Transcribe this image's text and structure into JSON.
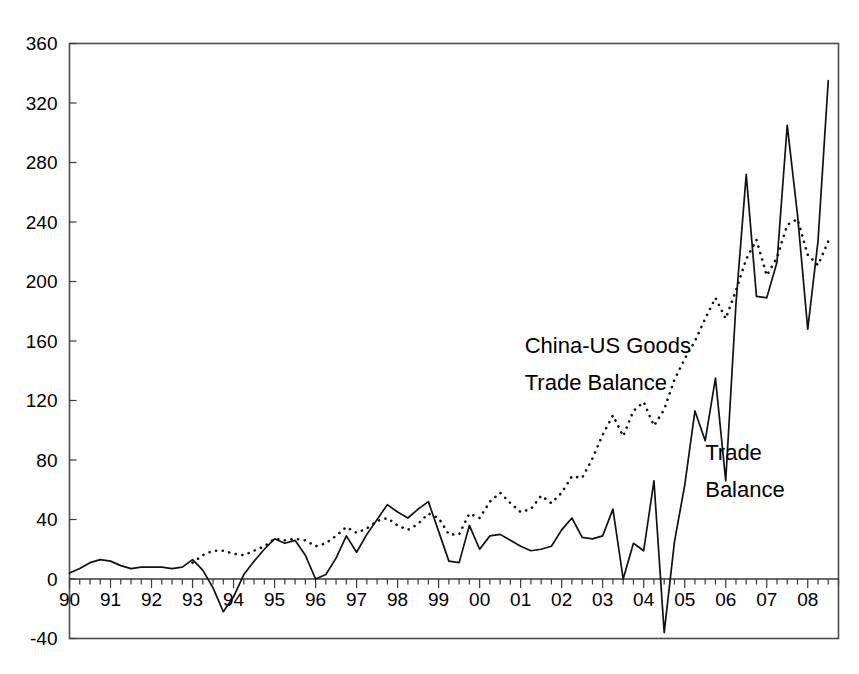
{
  "chart_data": {
    "type": "line",
    "title": "",
    "subtitle": "",
    "xlabel": "",
    "ylabel": "",
    "xlim": [
      1990.0,
      2008.75
    ],
    "ylim": [
      -40,
      360
    ],
    "yticks": [
      -40,
      0,
      40,
      80,
      120,
      160,
      200,
      240,
      280,
      320,
      360
    ],
    "ytick_labels": [
      "-40",
      "0",
      "40",
      "80",
      "120",
      "160",
      "200",
      "240",
      "280",
      "320",
      "360"
    ],
    "xticks": [
      1990,
      1991,
      1992,
      1993,
      1994,
      1995,
      1996,
      1997,
      1998,
      1999,
      2000,
      2001,
      2002,
      2003,
      2004,
      2005,
      2006,
      2007,
      2008
    ],
    "xtick_labels": [
      "90",
      "91",
      "92",
      "93",
      "94",
      "95",
      "96",
      "97",
      "98",
      "99",
      "00",
      "01",
      "02",
      "03",
      "04",
      "05",
      "06",
      "07",
      "08"
    ],
    "minor_tick_interval": 0.25,
    "grid": false,
    "legend": "annotations-inline",
    "frame": true,
    "zero_line": true,
    "annotations": [
      {
        "text": "China-US Goods",
        "x": 2001.1,
        "y": 152,
        "series": "china-us-goods-trade-balance"
      },
      {
        "text": "Trade Balance",
        "x": 2001.1,
        "y": 127,
        "series": "china-us-goods-trade-balance"
      },
      {
        "text": "Trade",
        "x": 2005.5,
        "y": 80,
        "series": "trade-balance"
      },
      {
        "text": "Balance",
        "x": 2005.5,
        "y": 55,
        "series": "trade-balance"
      }
    ],
    "series": [
      {
        "name": "Trade Balance",
        "style": "solid",
        "x": [
          1990.0,
          1990.25,
          1990.5,
          1990.75,
          1991.0,
          1991.25,
          1991.5,
          1991.75,
          1992.0,
          1992.25,
          1992.5,
          1992.75,
          1993.0,
          1993.25,
          1993.5,
          1993.75,
          1994.0,
          1994.25,
          1994.5,
          1994.75,
          1995.0,
          1995.25,
          1995.5,
          1995.75,
          1996.0,
          1996.25,
          1996.5,
          1996.75,
          1997.0,
          1997.25,
          1997.5,
          1997.75,
          1998.0,
          1998.25,
          1998.5,
          1998.75,
          1999.0,
          1999.25,
          1999.5,
          1999.75,
          2000.0,
          2000.25,
          2000.5,
          2000.75,
          2001.0,
          2001.25,
          2001.5,
          2001.75,
          2002.0,
          2002.25,
          2002.5,
          2002.75,
          2003.0,
          2003.25,
          2003.5,
          2003.75,
          2004.0,
          2004.25,
          2004.5,
          2004.75,
          2005.0,
          2005.25,
          2005.5,
          2005.75,
          2006.0,
          2006.25,
          2006.5,
          2006.75,
          2007.0,
          2007.25,
          2007.5,
          2007.75,
          2008.0,
          2008.25,
          2008.5
        ],
        "y": [
          4,
          7,
          11,
          13,
          12,
          9,
          7,
          8,
          8,
          8,
          7,
          8,
          13,
          6,
          -6,
          -22,
          -12,
          3,
          12,
          20,
          27,
          24,
          26,
          16,
          0,
          3,
          14,
          29,
          18,
          30,
          40,
          50,
          45,
          41,
          47,
          52,
          32,
          12,
          11,
          36,
          20,
          29,
          30,
          26,
          22,
          19,
          20,
          22,
          33,
          41,
          28,
          27,
          29,
          47,
          0,
          24,
          19,
          66,
          -36,
          25,
          63,
          113,
          93,
          135,
          66,
          185,
          272,
          190,
          189,
          213,
          305,
          245,
          168,
          227,
          335
        ]
      },
      {
        "name": "China-US Goods Trade Balance",
        "style": "dotted",
        "x": [
          1993.0,
          1993.25,
          1993.5,
          1993.75,
          1994.0,
          1994.25,
          1994.5,
          1994.75,
          1995.0,
          1995.25,
          1995.5,
          1995.75,
          1996.0,
          1996.25,
          1996.5,
          1996.75,
          1997.0,
          1997.25,
          1997.5,
          1997.75,
          1998.0,
          1998.25,
          1998.5,
          1998.75,
          1999.0,
          1999.25,
          1999.5,
          1999.75,
          2000.0,
          2000.25,
          2000.5,
          2000.75,
          2001.0,
          2001.25,
          2001.5,
          2001.75,
          2002.0,
          2002.25,
          2002.5,
          2002.75,
          2003.0,
          2003.25,
          2003.5,
          2003.75,
          2004.0,
          2004.25,
          2004.5,
          2004.75,
          2005.0,
          2005.25,
          2005.5,
          2005.75,
          2006.0,
          2006.25,
          2006.5,
          2006.75,
          2007.0,
          2007.25,
          2007.5,
          2007.75,
          2008.0,
          2008.25,
          2008.5
        ],
        "y": [
          11,
          16,
          19,
          19,
          17,
          16,
          19,
          22,
          27,
          26,
          27,
          26,
          22,
          24,
          29,
          35,
          31,
          34,
          39,
          41,
          36,
          33,
          37,
          44,
          41,
          30,
          30,
          44,
          41,
          52,
          58,
          51,
          45,
          47,
          56,
          51,
          58,
          69,
          68,
          81,
          97,
          110,
          96,
          113,
          119,
          103,
          114,
          134,
          148,
          160,
          175,
          189,
          175,
          194,
          215,
          228,
          204,
          216,
          238,
          242,
          218,
          211,
          227
        ]
      }
    ]
  },
  "colors": {
    "series_solid": "#111111",
    "series_dotted": "#111111",
    "frame": "#4a4a4a",
    "background": "#ffffff",
    "text": "#000000"
  }
}
